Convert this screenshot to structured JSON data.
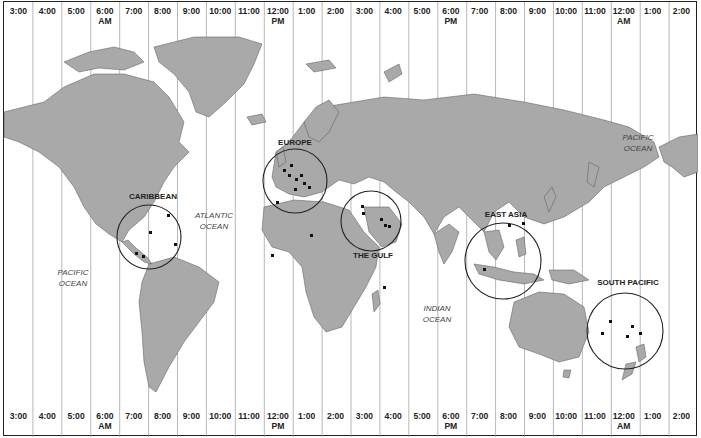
{
  "top_zones": [
    {
      "time": "3:00",
      "suffix": ""
    },
    {
      "time": "4:00",
      "suffix": ""
    },
    {
      "time": "5:00",
      "suffix": ""
    },
    {
      "time": "6:00",
      "suffix": "AM"
    },
    {
      "time": "7:00",
      "suffix": ""
    },
    {
      "time": "8:00",
      "suffix": ""
    },
    {
      "time": "9:00",
      "suffix": ""
    },
    {
      "time": "10:00",
      "suffix": ""
    },
    {
      "time": "11:00",
      "suffix": ""
    },
    {
      "time": "12:00",
      "suffix": "PM"
    },
    {
      "time": "1:00",
      "suffix": ""
    },
    {
      "time": "2:00",
      "suffix": ""
    },
    {
      "time": "3:00",
      "suffix": ""
    },
    {
      "time": "4:00",
      "suffix": ""
    },
    {
      "time": "5:00",
      "suffix": ""
    },
    {
      "time": "6:00",
      "suffix": "PM"
    },
    {
      "time": "7:00",
      "suffix": ""
    },
    {
      "time": "8:00",
      "suffix": ""
    },
    {
      "time": "9:00",
      "suffix": ""
    },
    {
      "time": "10:00",
      "suffix": ""
    },
    {
      "time": "11:00",
      "suffix": ""
    },
    {
      "time": "12:00",
      "suffix": "AM"
    },
    {
      "time": "1:00",
      "suffix": ""
    },
    {
      "time": "2:00",
      "suffix": ""
    }
  ],
  "bottom_zones": [
    {
      "time": "3:00",
      "suffix": ""
    },
    {
      "time": "4:00",
      "suffix": ""
    },
    {
      "time": "5:00",
      "suffix": ""
    },
    {
      "time": "6:00",
      "suffix": "AM"
    },
    {
      "time": "7:00",
      "suffix": ""
    },
    {
      "time": "8:00",
      "suffix": ""
    },
    {
      "time": "9:00",
      "suffix": ""
    },
    {
      "time": "10:00",
      "suffix": ""
    },
    {
      "time": "11:00",
      "suffix": ""
    },
    {
      "time": "12:00",
      "suffix": "PM"
    },
    {
      "time": "1:00",
      "suffix": ""
    },
    {
      "time": "2:00",
      "suffix": ""
    },
    {
      "time": "3:00",
      "suffix": ""
    },
    {
      "time": "4:00",
      "suffix": ""
    },
    {
      "time": "5:00",
      "suffix": ""
    },
    {
      "time": "6:00",
      "suffix": "PM"
    },
    {
      "time": "7:00",
      "suffix": ""
    },
    {
      "time": "8:00",
      "suffix": ""
    },
    {
      "time": "9:00",
      "suffix": ""
    },
    {
      "time": "10:00",
      "suffix": ""
    },
    {
      "time": "11:00",
      "suffix": ""
    },
    {
      "time": "12:00",
      "suffix": "AM"
    },
    {
      "time": "1:00",
      "suffix": ""
    },
    {
      "time": "2:00",
      "suffix": ""
    }
  ],
  "regions": [
    {
      "name": "EUROPE",
      "cx": 294,
      "cy": 180,
      "r": 32,
      "label_x": 294,
      "label_y": 137
    },
    {
      "name": "CARIBBEAN",
      "cx": 148,
      "cy": 236,
      "r": 32,
      "label_x": 152,
      "label_y": 191
    },
    {
      "name": "THE GULF",
      "cx": 370,
      "cy": 220,
      "r": 30,
      "label_x": 372,
      "label_y": 250
    },
    {
      "name": "EAST ASIA",
      "cx": 502,
      "cy": 260,
      "r": 38,
      "label_x": 505,
      "label_y": 209
    },
    {
      "name": "SOUTH PACIFIC",
      "cx": 624,
      "cy": 330,
      "r": 38,
      "label_x": 627,
      "label_y": 277
    }
  ],
  "oceans": [
    {
      "line1": "PACIFIC",
      "line2": "OCEAN",
      "x": 72,
      "y": 266
    },
    {
      "line1": "ATLANTIC",
      "line2": "OCEAN",
      "x": 213,
      "y": 209
    },
    {
      "line1": "INDIAN",
      "line2": "OCEAN",
      "x": 436,
      "y": 302
    },
    {
      "line1": "PACIFIC",
      "line2": "OCEAN",
      "x": 637,
      "y": 131
    }
  ],
  "colors": {
    "land": "#a9a9a9",
    "water": "#ffffff",
    "border": "#222222",
    "zone_line": "#9a9a9a"
  }
}
